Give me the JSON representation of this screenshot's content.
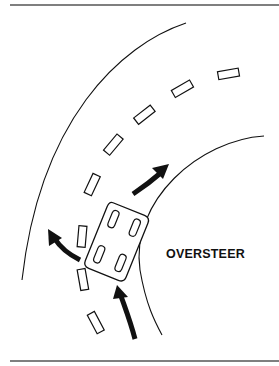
{
  "diagram": {
    "label": "OVERSTEER",
    "colors": {
      "ink": "#111111",
      "background": "#ffffff",
      "rule": "#555555"
    },
    "elements": {
      "road_outer_edge": "curved line",
      "road_inner_edge": "curved line",
      "lane_dashes": 9,
      "car": "top-down car, rotated, sliding",
      "arrows": [
        "intended-path arrow (up-right)",
        "rear swing arrow (left)",
        "approach arrow (from bottom)"
      ]
    }
  }
}
